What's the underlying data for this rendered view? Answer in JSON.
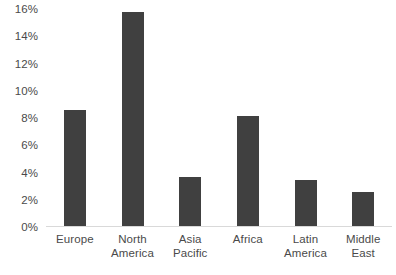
{
  "chart_data": {
    "type": "bar",
    "title": "",
    "subtitle": "",
    "xlabel": "",
    "ylabel": "",
    "categories": [
      "Europe",
      "North America",
      "Asia Pacific",
      "Africa",
      "Latin America",
      "Middle East"
    ],
    "values": [
      8.5,
      15.7,
      3.6,
      8.1,
      3.4,
      2.5
    ],
    "value_labels": [
      "8.5%",
      "15.7%",
      "3.6%",
      "8.1%",
      "3.4%",
      "2.5%"
    ],
    "series": [
      {
        "name": "",
        "values": [
          8.5,
          15.7,
          3.6,
          8.1,
          3.4,
          2.5
        ]
      }
    ],
    "ylim": [
      0,
      16
    ],
    "ytick_values": [
      16,
      14,
      12,
      10,
      8,
      6,
      4,
      2,
      0
    ],
    "ytick_labels": [
      "16%",
      "14%",
      "12%",
      "10%",
      "8%",
      "6%",
      "4%",
      "2%",
      "0%"
    ],
    "grid": false,
    "legend": false,
    "legend_position": "none",
    "annotations": [],
    "bar_color": "#404040",
    "axis_line_color": "#d9d9d9",
    "tick_label_color": "#4a4a4a",
    "background_color": "#ffffff"
  },
  "x_axis_label_lines": [
    [
      "Europe"
    ],
    [
      "North",
      "America"
    ],
    [
      "Asia Pacific"
    ],
    [
      "Africa"
    ],
    [
      "Latin",
      "America"
    ],
    [
      "Middle",
      "East"
    ]
  ]
}
